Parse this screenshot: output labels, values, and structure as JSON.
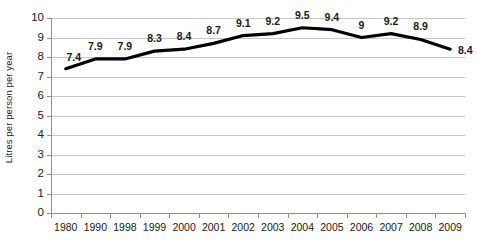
{
  "chart_data": {
    "type": "line",
    "title": "",
    "subtitle": "",
    "xlabel": "",
    "ylabel": "Litres per person per year",
    "categories": [
      "1980",
      "1990",
      "1998",
      "1999",
      "2000",
      "2001",
      "2002",
      "2003",
      "2004",
      "2005",
      "2006",
      "2007",
      "2008",
      "2009"
    ],
    "values": [
      7.4,
      7.9,
      7.9,
      8.3,
      8.4,
      8.7,
      9.1,
      9.2,
      9.5,
      9.4,
      9.0,
      9.2,
      8.9,
      8.4
    ],
    "point_labels": [
      "7.4",
      "7.9",
      "7.9",
      "8.3",
      "8.4",
      "8.7",
      "9.1",
      "9.2",
      "9.5",
      "9.4",
      "9",
      "9.2",
      "8.9",
      "8.4"
    ],
    "ylim": [
      0,
      10
    ],
    "ytick_values": [
      0,
      1,
      2,
      3,
      4,
      5,
      6,
      7,
      8,
      9,
      10
    ],
    "ytick_labels": [
      "0",
      "1",
      "2",
      "3",
      "4",
      "5",
      "6",
      "7",
      "8",
      "9",
      "10"
    ],
    "grid": true,
    "legend": null,
    "legend_position": "none",
    "series": [
      {
        "name": "Litres per person per year",
        "color": "#000000",
        "values": [
          7.4,
          7.9,
          7.9,
          8.3,
          8.4,
          8.7,
          9.1,
          9.2,
          9.5,
          9.4,
          9.0,
          9.2,
          8.9,
          8.4
        ]
      }
    ],
    "colors": {
      "line": "#000000",
      "grid": "#c8c8c8",
      "axis": "#8f8f8f",
      "text": "#1a1a1a",
      "background": "#ffffff"
    }
  }
}
